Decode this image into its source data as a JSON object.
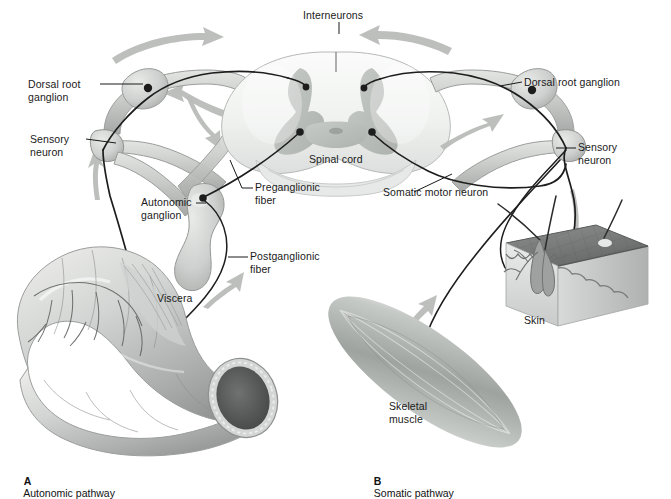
{
  "figure": {
    "panels": [
      {
        "id": "A",
        "letter": "A",
        "caption": "Autonomic pathway",
        "x": 18,
        "y": 463
      },
      {
        "id": "B",
        "letter": "B",
        "caption": "Somatic pathway",
        "x": 368,
        "y": 463
      }
    ]
  },
  "labels": [
    {
      "name": "interneurons",
      "text": "Interneurons",
      "x": 303,
      "y": 9,
      "align": "left"
    },
    {
      "name": "dorsal-root-ganglion-left",
      "text": "Dorsal root\nganglion",
      "x": 28,
      "y": 78,
      "align": "left"
    },
    {
      "name": "sensory-neuron-left",
      "text": "Sensory\nneuron",
      "x": 30,
      "y": 133,
      "align": "left"
    },
    {
      "name": "spinal-cord",
      "text": "Spinal cord",
      "x": 309,
      "y": 153,
      "align": "left"
    },
    {
      "name": "preganglionic-fiber",
      "text": "Preganglionic\nfiber",
      "x": 255,
      "y": 181,
      "align": "left"
    },
    {
      "name": "autonomic-ganglion",
      "text": "Autonomic\nganglion",
      "x": 141,
      "y": 196,
      "align": "left"
    },
    {
      "name": "postganglionic-fiber",
      "text": "Postganglionic\nfiber",
      "x": 250,
      "y": 250,
      "align": "left"
    },
    {
      "name": "viscera",
      "text": "Viscera",
      "x": 157,
      "y": 292,
      "align": "left"
    },
    {
      "name": "dorsal-root-ganglion-right",
      "text": "Dorsal root ganglion",
      "x": 524,
      "y": 76,
      "align": "left"
    },
    {
      "name": "sensory-neuron-right",
      "text": "Sensory\nneuron",
      "x": 578,
      "y": 141,
      "align": "left"
    },
    {
      "name": "somatic-motor-neuron",
      "text": "Somatic motor neuron",
      "x": 383,
      "y": 186,
      "align": "left"
    },
    {
      "name": "skin",
      "text": "Skin",
      "x": 524,
      "y": 314,
      "align": "left"
    },
    {
      "name": "skeletal-muscle",
      "text": "Skeletal\nmuscle",
      "x": 389,
      "y": 400,
      "align": "left"
    }
  ],
  "colors": {
    "nerve_line": "#1d1d1d",
    "nerve_sheath": "#c9ccc9",
    "nerve_sheath_dark": "#a7aaa7",
    "arrow_gray": "#b9bcb9",
    "cord_white_matter": "#eff1ef",
    "cord_gray_matter": "#bcc0bd",
    "viscera_light": "#dfe1df",
    "viscera_mid": "#b9bcba",
    "viscera_dark": "#8d908e",
    "muscle_mid": "#a9aeab",
    "skin_surface": "#7c7f7e",
    "skin_side": "#d6d8d7",
    "label_text": "#1a1a1a",
    "background": "#ffffff"
  },
  "structures": {
    "spinal_cord": "transverse section with butterfly-shaped gray matter, central canal, dorsal and ventral horns",
    "ganglia": [
      "dorsal root ganglion (left)",
      "dorsal root ganglion (right)",
      "autonomic ganglion"
    ],
    "effectors": [
      "viscera (intestine)",
      "skeletal muscle",
      "skin"
    ],
    "arrow_count": 8
  }
}
